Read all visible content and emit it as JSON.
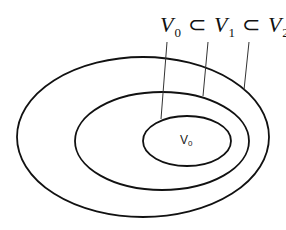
{
  "diagram": {
    "type": "nested-sets",
    "formula": {
      "parts": [
        {
          "symbol": "V",
          "subscript": "0"
        },
        {
          "operator": "⊂"
        },
        {
          "symbol": "V",
          "subscript": "1"
        },
        {
          "operator": "⊂"
        },
        {
          "symbol": "V",
          "subscript": "2"
        }
      ],
      "text": "V0 ⊂ V1 ⊂ V2"
    },
    "inner_label": {
      "symbol": "V",
      "subscript": "0"
    },
    "ellipses": [
      {
        "name": "V2",
        "cx": 143,
        "cy": 137,
        "rx": 126,
        "ry": 80
      },
      {
        "name": "V1",
        "cx": 162,
        "cy": 141,
        "rx": 87,
        "ry": 49
      },
      {
        "name": "V0",
        "cx": 187,
        "cy": 141,
        "rx": 44,
        "ry": 25
      }
    ],
    "stroke_color": "#111111"
  }
}
